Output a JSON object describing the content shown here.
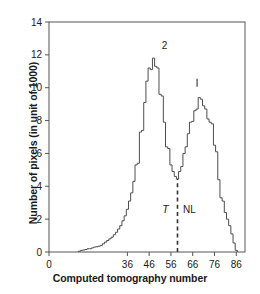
{
  "chart_data": {
    "type": "line",
    "subtype": "histogram-outline",
    "title": "",
    "xlabel": "Computed tomography number",
    "ylabel": "Number of pixels (in unit of 1000)",
    "xlim": [
      0,
      90
    ],
    "ylim": [
      0,
      14
    ],
    "xticks": [
      0,
      36,
      46,
      56,
      66,
      76,
      86
    ],
    "yticks": [
      0,
      2,
      4,
      6,
      8,
      10,
      12,
      14
    ],
    "grid": false,
    "legend": null,
    "annotations": [
      {
        "name": "left-peak-label",
        "text": "2",
        "x": 53,
        "y": 12.35
      },
      {
        "name": "right-peak-marker",
        "text": "|",
        "x": 68,
        "y": 10.3
      },
      {
        "name": "tumor-region-label",
        "text": "T",
        "x": 53.5,
        "y": 2.4,
        "style": "italic"
      },
      {
        "name": "normal-liver-region-label",
        "text": "NL",
        "x": 64.5,
        "y": 2.4,
        "style": "normal"
      },
      {
        "name": "threshold-line",
        "text": "",
        "x": 59,
        "y_from": 0,
        "y_to": 4.45,
        "style": "dashed"
      }
    ],
    "series": [
      {
        "name": "pixel-count-histogram",
        "color": "#4d4d4d",
        "x": [
          14,
          15,
          16,
          17,
          18,
          19,
          20,
          21,
          22,
          23,
          24,
          25,
          26,
          27,
          28,
          29,
          30,
          31,
          32,
          33,
          34,
          35,
          36,
          37,
          38,
          39,
          40,
          41,
          42,
          43,
          44,
          45,
          46,
          47,
          48,
          49,
          50,
          51,
          52,
          53,
          54,
          55,
          56,
          57,
          58,
          59,
          60,
          61,
          62,
          63,
          64,
          65,
          66,
          67,
          68,
          69,
          70,
          71,
          72,
          73,
          74,
          75,
          76,
          77,
          78,
          79,
          80,
          81,
          82,
          83,
          84,
          85,
          86
        ],
        "values": [
          0.05,
          0.1,
          0.12,
          0.15,
          0.2,
          0.2,
          0.25,
          0.3,
          0.32,
          0.35,
          0.4,
          0.5,
          0.6,
          0.7,
          0.8,
          0.9,
          1.05,
          1.2,
          1.4,
          1.6,
          1.9,
          2.2,
          2.6,
          3.1,
          3.6,
          4.3,
          5.3,
          5.4,
          7.3,
          7.4,
          9.1,
          10.4,
          11.2,
          11.1,
          11.8,
          11.3,
          11.2,
          9.6,
          9.5,
          7.9,
          6.4,
          6.3,
          5.3,
          4.9,
          4.6,
          4.45,
          4.9,
          5.2,
          6.0,
          6.4,
          7.2,
          7.9,
          7.95,
          8.6,
          8.7,
          9.4,
          9.3,
          8.9,
          8.7,
          8.1,
          7.9,
          7.8,
          6.5,
          6.1,
          4.4,
          3.3,
          3.1,
          2.4,
          2.0,
          1.6,
          1.1,
          0.55,
          0.1
        ]
      }
    ]
  },
  "axes": {
    "x_title": "Computed tomography number",
    "y_title": "Number of pixels (in unit of 1000)",
    "x_tick_labels": [
      "0",
      "36",
      "46",
      "56",
      "66",
      "76",
      "86"
    ],
    "y_tick_labels": [
      "0",
      "2",
      "4",
      "6",
      "8",
      "10",
      "12",
      "14"
    ]
  },
  "colors": {
    "frame": "#555555",
    "curve": "#4d4d4d",
    "text": "#1a1a1a",
    "threshold": "#333333",
    "background": "#ffffff"
  }
}
